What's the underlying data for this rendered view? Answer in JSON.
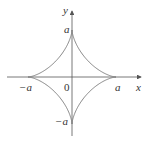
{
  "diagram": {
    "type": "astroid",
    "equation": "x^(2/3) + y^(2/3) = a^(2/3)",
    "axes": {
      "x_label": "x",
      "y_label": "y"
    },
    "labels": {
      "origin": "0",
      "pos_x": "a",
      "neg_x": "−a",
      "pos_y": "a",
      "neg_y": "−a"
    },
    "colors": {
      "curve": "#777777",
      "axis": "#555555",
      "text": "#333333"
    }
  }
}
